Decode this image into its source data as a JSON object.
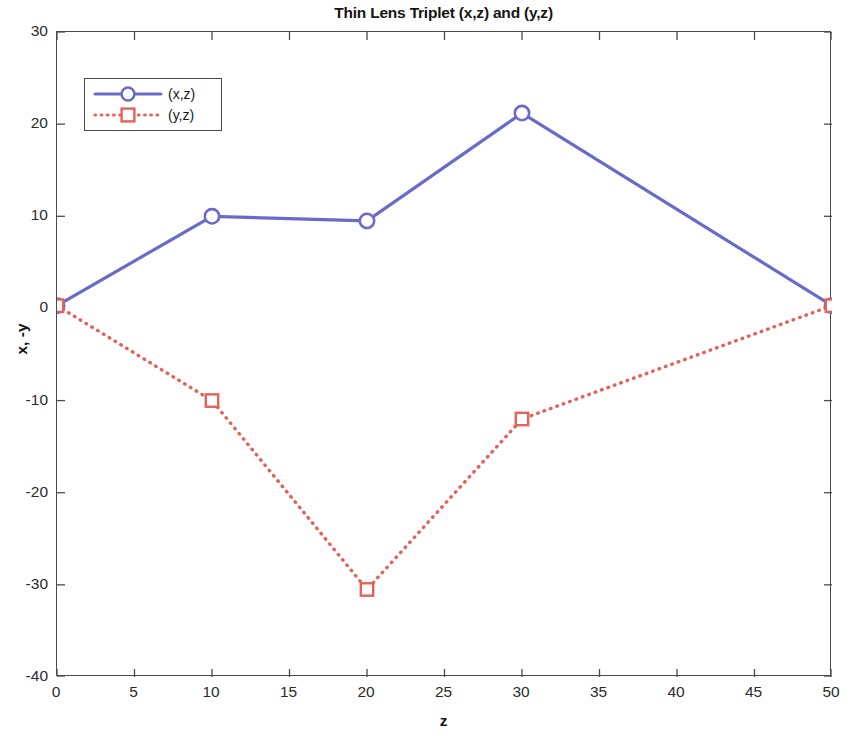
{
  "chart_data": {
    "type": "line",
    "title": "Thin Lens Triplet (x,z) and (y,z)",
    "xlabel": "z",
    "ylabel": "x, -y",
    "xlim": [
      0,
      50
    ],
    "ylim": [
      -40,
      30
    ],
    "xticks": [
      0,
      5,
      10,
      15,
      20,
      25,
      30,
      35,
      40,
      45,
      50
    ],
    "yticks": [
      30,
      20,
      10,
      0,
      -10,
      -20,
      -30,
      -40
    ],
    "xtick_labels": [
      "0",
      "5",
      "10",
      "15",
      "20",
      "25",
      "30",
      "35",
      "40",
      "45",
      "50"
    ],
    "ytick_labels": [
      "30",
      "20",
      "10",
      "0",
      "-10",
      "-20",
      "-30",
      "-40"
    ],
    "grid": false,
    "legend_position": "upper left",
    "series": [
      {
        "name": "(x,z)",
        "color": "#6A6ACD",
        "linestyle": "solid",
        "marker": "circle",
        "x": [
          0,
          10,
          20,
          30,
          50
        ],
        "values": [
          0.3,
          10.0,
          9.5,
          21.2,
          0.3
        ]
      },
      {
        "name": "(y,z)",
        "color": "#E8605A",
        "linestyle": "dotted",
        "marker": "square",
        "x": [
          0,
          10,
          20,
          30,
          50
        ],
        "values": [
          0.3,
          -10.0,
          -30.5,
          -12.0,
          0.3
        ]
      }
    ]
  },
  "legend": {
    "entries": [
      {
        "label": "(x,z)"
      },
      {
        "label": "(y,z)"
      }
    ]
  }
}
